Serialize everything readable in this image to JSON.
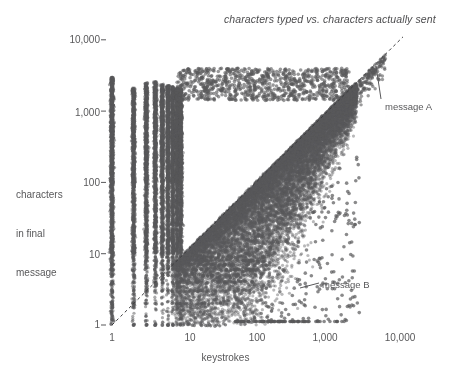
{
  "chart_data": {
    "type": "scatter",
    "title": "characters typed vs. characters actually sent",
    "xlabel": "keystrokes",
    "ylabel": "characters\nin final\nmessage",
    "ylabel_lines": [
      "characters",
      "in final",
      "message"
    ],
    "xscale": "log",
    "yscale": "log",
    "xlim": [
      1,
      20000
    ],
    "ylim": [
      1,
      20000
    ],
    "grid": false,
    "legend": null,
    "point_color": "#58585a",
    "point_opacity": 0.55,
    "point_radius": 1.6,
    "background_color": "#ffffff",
    "axis_text_color": "#58585a",
    "xticks": [
      {
        "value": 1,
        "label": "1"
      },
      {
        "value": 10,
        "label": "10"
      },
      {
        "value": 100,
        "label": "100"
      },
      {
        "value": 1000,
        "label": "1,000"
      },
      {
        "value": 10000,
        "label": "10,000"
      }
    ],
    "yticks": [
      {
        "value": 1,
        "label": "1"
      },
      {
        "value": 10,
        "label": "10"
      },
      {
        "value": 100,
        "label": "100"
      },
      {
        "value": 1000,
        "label": "1,000"
      },
      {
        "value": 10000,
        "label": "10,000"
      }
    ],
    "reference_line": {
      "name": "identity-line",
      "style": "dashed",
      "from": [
        1,
        1
      ],
      "to": [
        11000,
        11000
      ],
      "description": "y = x, characters sent equals keystrokes typed"
    },
    "annotations": [
      {
        "name": "message-a",
        "label": "message A",
        "label_x_px": 385,
        "label_y_px": 101,
        "leader_from_px": [
          381,
          99
        ],
        "leader_to_px": [
          376,
          66
        ],
        "target_point": [
          6800,
          6800
        ],
        "description": "point far up the diagonal, many keystrokes and long final message"
      },
      {
        "name": "message-b",
        "label": "message B",
        "label_x_px": 322,
        "label_y_px": 279,
        "leader_from_px": [
          319,
          283
        ],
        "leader_to_px": [
          300,
          288
        ],
        "target_point": [
          520,
          3
        ],
        "description": "point far below the diagonal, many keystrokes but almost nothing sent"
      }
    ],
    "point_count_approx": 22000,
    "structure_notes": [
      "dense cloud sits above and left of the y=x dashed line",
      "discrete vertical stripes at integer keystroke counts 1 through ~9",
      "discrete horizontal rows at small integer character counts 1 through ~9",
      "cloud narrows and hugs the diagonal at high keystroke counts",
      "sparse scattered outliers below the main mass on the right side"
    ]
  },
  "axes": {
    "x_label": "keystrokes",
    "y_label_lines": [
      "characters",
      "in final",
      "message"
    ]
  },
  "title": {
    "text": "characters typed vs. characters actually sent"
  },
  "annotations": {
    "a_label": "message A",
    "b_label": "message B"
  }
}
